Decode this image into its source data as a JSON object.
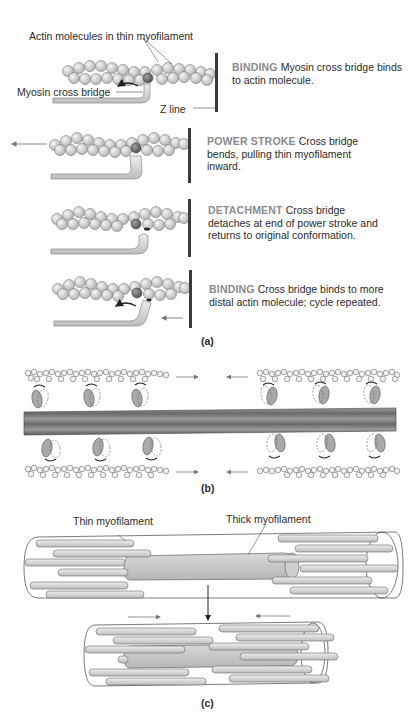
{
  "panel_a": {
    "labels": {
      "actin": "Actin molecules in thin myofilament",
      "cross_bridge": "Myosin cross bridge",
      "z_line": "Z line"
    },
    "steps": [
      {
        "heading": "BINDING",
        "text": "Myosin cross bridge binds to actin molecule."
      },
      {
        "heading": "POWER STROKE",
        "text": "Cross bridge bends, pulling thin myofilament inward."
      },
      {
        "heading": "DETACHMENT",
        "text": "Cross bridge detaches at end of power stroke and returns to original conformation."
      },
      {
        "heading": "BINDING",
        "text": "Cross bridge binds to more distal actin molecule; cycle repeated."
      }
    ],
    "caption": "(a)"
  },
  "panel_b": {
    "caption": "(b)"
  },
  "panel_c": {
    "labels": {
      "thin": "Thin myofilament",
      "thick": "Thick myofilament"
    },
    "caption": "(c)"
  },
  "colors": {
    "actin_fill": "#d9d9d9",
    "actin_dark": "#8c8c8c",
    "heading_gray": "#8a8a8a",
    "z_line": "#3a3a3a",
    "thick_filament": "#c8c8c8"
  }
}
